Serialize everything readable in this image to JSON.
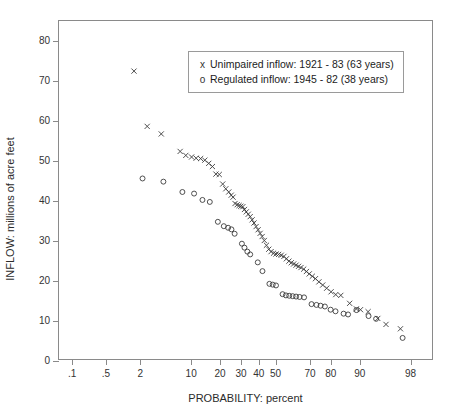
{
  "chart": {
    "type": "scatter",
    "title": "",
    "xlabel": "PROBABILITY:  percent",
    "ylabel": "INFLOW:  millions of acre feet",
    "ylim": [
      0,
      85
    ],
    "yticks": [
      0,
      10,
      20,
      30,
      40,
      50,
      60,
      70,
      80
    ],
    "ytick_labels": [
      "0",
      "10",
      "20",
      "30",
      "40",
      "50",
      "60",
      "70",
      "80"
    ],
    "xscale": "normal-probability",
    "xlim": [
      0.05,
      99.2
    ],
    "xticks": [
      0.1,
      0.5,
      2,
      10,
      20,
      30,
      40,
      50,
      70,
      80,
      90,
      98
    ],
    "xtick_labels": [
      ".1",
      ".5",
      "2",
      "10",
      "20",
      "30",
      "40",
      "50",
      "70",
      "80",
      "90",
      "98"
    ],
    "grid": false,
    "legend_position": "top-center",
    "marker_color": "#3b3b3b"
  },
  "legend": {
    "entries": [
      {
        "marker": "x",
        "label": "Unimpaired inflow:  1921 - 83  (63 years)"
      },
      {
        "marker": "o",
        "label": "Regulated inflow:  1945 - 82  (38 years)"
      }
    ]
  },
  "chart_data": {
    "type": "scatter",
    "title": "",
    "xlabel": "PROBABILITY:  percent",
    "ylabel": "INFLOW:  millions of acre feet",
    "xscale": "normal-probability",
    "xlim": [
      0.05,
      99.2
    ],
    "ylim": [
      0,
      85
    ],
    "xticks": [
      0.1,
      0.5,
      2,
      10,
      20,
      30,
      40,
      50,
      70,
      80,
      90,
      98
    ],
    "xtick_labels": [
      ".1",
      ".5",
      "2",
      "10",
      "20",
      "30",
      "40",
      "50",
      "70",
      "80",
      "90",
      "98"
    ],
    "yticks": [
      0,
      10,
      20,
      30,
      40,
      50,
      60,
      70,
      80
    ],
    "grid": false,
    "legend_position": "top-center",
    "series": [
      {
        "name": "Unimpaired inflow:  1921 - 83  (63 years)",
        "marker": "x",
        "color": "#3b3b3b",
        "n": 63,
        "points": [
          [
            1.6,
            72.4
          ],
          [
            2.6,
            58.5
          ],
          [
            4.2,
            56.6
          ],
          [
            7.5,
            52.2
          ],
          [
            8.8,
            51.2
          ],
          [
            10.3,
            50.8
          ],
          [
            11.6,
            50.5
          ],
          [
            13.0,
            50.4
          ],
          [
            14.4,
            50.0
          ],
          [
            15.8,
            49.2
          ],
          [
            17.2,
            48.4
          ],
          [
            18.6,
            46.5
          ],
          [
            20.0,
            46.4
          ],
          [
            21.5,
            44.0
          ],
          [
            22.9,
            42.8
          ],
          [
            24.3,
            42.0
          ],
          [
            25.5,
            41.2
          ],
          [
            26.4,
            40.7
          ],
          [
            27.4,
            39.1
          ],
          [
            28.5,
            38.8
          ],
          [
            29.5,
            38.6
          ],
          [
            30.4,
            38.4
          ],
          [
            31.5,
            38.3
          ],
          [
            32.4,
            37.6
          ],
          [
            33.4,
            37.0
          ],
          [
            34.5,
            36.4
          ],
          [
            35.6,
            35.8
          ],
          [
            36.7,
            35.0
          ],
          [
            37.8,
            34.2
          ],
          [
            39.0,
            33.3
          ],
          [
            40.2,
            32.5
          ],
          [
            41.4,
            31.6
          ],
          [
            42.6,
            30.8
          ],
          [
            43.9,
            29.8
          ],
          [
            45.2,
            28.6
          ],
          [
            46.6,
            27.6
          ],
          [
            48.0,
            27.0
          ],
          [
            49.5,
            26.6
          ],
          [
            51.0,
            26.4
          ],
          [
            52.6,
            26.3
          ],
          [
            54.2,
            26.1
          ],
          [
            55.8,
            25.8
          ],
          [
            57.3,
            25.2
          ],
          [
            58.8,
            24.6
          ],
          [
            60.2,
            24.2
          ],
          [
            61.6,
            23.9
          ],
          [
            63.0,
            23.6
          ],
          [
            64.4,
            23.3
          ],
          [
            65.8,
            23.0
          ],
          [
            67.3,
            22.6
          ],
          [
            68.8,
            22.0
          ],
          [
            70.3,
            21.4
          ],
          [
            71.9,
            20.8
          ],
          [
            73.5,
            20.2
          ],
          [
            75.2,
            19.4
          ],
          [
            77.0,
            18.6
          ],
          [
            78.8,
            17.8
          ],
          [
            80.7,
            16.9
          ],
          [
            82.6,
            16.2
          ],
          [
            84.5,
            16.0
          ],
          [
            87.5,
            14.0
          ],
          [
            89.5,
            12.6
          ],
          [
            90.6,
            12.4
          ],
          [
            92.4,
            11.9
          ],
          [
            94.3,
            10.2
          ],
          [
            95.6,
            8.7
          ],
          [
            97.3,
            7.6
          ]
        ]
      },
      {
        "name": "Regulated inflow:  1945 - 82  (38 years)",
        "marker": "o",
        "color": "#3b3b3b",
        "n": 38,
        "points": [
          [
            2.2,
            45.4
          ],
          [
            4.5,
            44.6
          ],
          [
            8.0,
            42.0
          ],
          [
            11.0,
            41.6
          ],
          [
            13.6,
            40.0
          ],
          [
            16.2,
            39.5
          ],
          [
            19.4,
            34.5
          ],
          [
            22.0,
            33.4
          ],
          [
            24.0,
            33.0
          ],
          [
            25.6,
            32.6
          ],
          [
            27.2,
            31.5
          ],
          [
            31.0,
            29.0
          ],
          [
            32.4,
            28.0
          ],
          [
            34.0,
            27.0
          ],
          [
            35.6,
            26.3
          ],
          [
            40.0,
            24.3
          ],
          [
            42.8,
            22.1
          ],
          [
            47.0,
            18.9
          ],
          [
            49.0,
            18.7
          ],
          [
            51.0,
            18.5
          ],
          [
            55.0,
            16.3
          ],
          [
            57.0,
            16.0
          ],
          [
            59.0,
            15.9
          ],
          [
            61.0,
            15.8
          ],
          [
            63.0,
            15.7
          ],
          [
            65.0,
            15.6
          ],
          [
            67.5,
            15.5
          ],
          [
            71.5,
            13.8
          ],
          [
            74.0,
            13.6
          ],
          [
            76.0,
            13.4
          ],
          [
            78.0,
            13.2
          ],
          [
            80.5,
            12.4
          ],
          [
            82.5,
            12.0
          ],
          [
            85.5,
            11.4
          ],
          [
            87.0,
            11.2
          ],
          [
            89.5,
            12.3
          ],
          [
            92.5,
            10.8
          ],
          [
            94.0,
            10.1
          ],
          [
            97.5,
            5.3
          ]
        ]
      }
    ]
  }
}
